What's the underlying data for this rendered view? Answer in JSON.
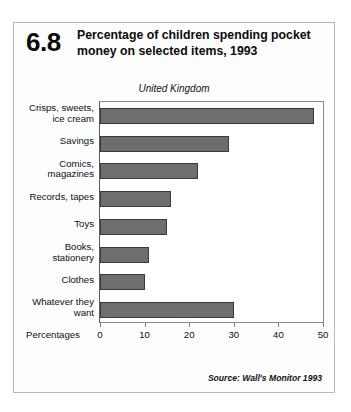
{
  "figure": {
    "number": "6.8",
    "title": "Percentage of children spending pocket money on selected items, 1993",
    "subtitle": "United Kingdom",
    "source": "Source: Wall's Monitor 1993"
  },
  "chart_data": {
    "type": "bar",
    "orientation": "horizontal",
    "title": "Percentage of children spending pocket money on selected items, 1993",
    "subtitle": "United Kingdom",
    "categories": [
      "Crisps, sweets, ice cream",
      "Savings",
      "Comics, magazines",
      "Records, tapes",
      "Toys",
      "Books, stationery",
      "Clothes",
      "Whatever they want"
    ],
    "values": [
      48,
      29,
      22,
      16,
      15,
      11,
      10,
      30
    ],
    "xlabel": "Percentages",
    "ylabel": "",
    "xlim": [
      0,
      50
    ],
    "xticks": [
      0,
      10,
      20,
      30,
      40,
      50
    ],
    "xtick_labels": [
      "0",
      "10",
      "20",
      "30",
      "40",
      "50"
    ],
    "grid": false,
    "legend": false,
    "bar_color": "#6e6e6e",
    "bar_edge_color": "#3a3a3a"
  },
  "category_lines": [
    [
      "Crisps, sweets,",
      "ice cream"
    ],
    [
      "Savings"
    ],
    [
      "Comics,",
      "magazines"
    ],
    [
      "Records, tapes"
    ],
    [
      "Toys"
    ],
    [
      "Books,",
      "stationery"
    ],
    [
      "Clothes"
    ],
    [
      "Whatever they",
      "want"
    ]
  ]
}
